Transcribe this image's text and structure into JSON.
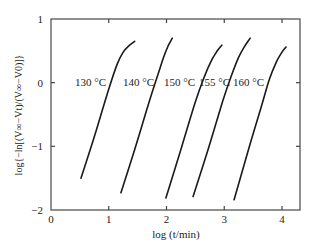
{
  "chart_data": {
    "type": "line",
    "title": "",
    "xlabel": "log (t/min)",
    "ylabel": "log{−ln[(V∞−Vt)/(V∞−V0)]}",
    "xlim": [
      0,
      4.3
    ],
    "ylim": [
      -2,
      1
    ],
    "xticks": [
      0,
      1,
      2,
      3,
      4
    ],
    "yticks": [
      1,
      0,
      -1,
      -2
    ],
    "grid": false,
    "legend": "inline labels",
    "series": [
      {
        "name": "130 °C",
        "x": [
          0.52,
          0.75,
          1.0,
          1.15,
          1.25,
          1.35,
          1.45
        ],
        "y": [
          -1.5,
          -0.85,
          -0.1,
          0.3,
          0.48,
          0.58,
          0.65
        ]
      },
      {
        "name": "140 °C",
        "x": [
          1.21,
          1.45,
          1.7,
          1.85,
          1.95,
          2.03,
          2.1
        ],
        "y": [
          -1.73,
          -1.05,
          -0.3,
          0.12,
          0.4,
          0.58,
          0.7
        ]
      },
      {
        "name": "150 °C",
        "x": [
          1.99,
          2.25,
          2.5,
          2.65,
          2.78,
          2.88,
          2.96
        ],
        "y": [
          -1.81,
          -1.05,
          -0.3,
          0.08,
          0.35,
          0.5,
          0.59
        ]
      },
      {
        "name": "155 °C",
        "x": [
          2.46,
          2.72,
          2.97,
          3.12,
          3.25,
          3.36,
          3.45
        ],
        "y": [
          -1.79,
          -1.05,
          -0.3,
          0.1,
          0.4,
          0.58,
          0.7
        ]
      },
      {
        "name": "160 °C",
        "x": [
          3.17,
          3.42,
          3.65,
          3.78,
          3.9,
          4.0,
          4.07
        ],
        "y": [
          -1.84,
          -1.05,
          -0.35,
          0.05,
          0.32,
          0.48,
          0.56
        ]
      }
    ]
  },
  "labels": {
    "xlabel": "log (t/min)",
    "series_labels": [
      "130 °C",
      "140 °C",
      "150 °C",
      "155 °C",
      "160 °C"
    ]
  }
}
